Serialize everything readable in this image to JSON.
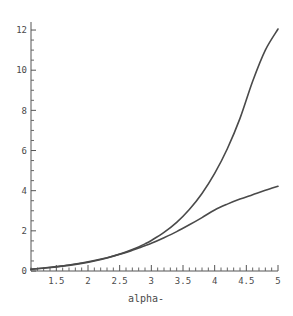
{
  "chart_data": {
    "type": "line",
    "title": "",
    "subtitle": "",
    "xlabel": "alpha-",
    "ylabel": "",
    "xlim": [
      1.1,
      5.0
    ],
    "ylim": [
      0,
      12.4
    ],
    "grid": false,
    "legend": null,
    "x_ticks": [
      {
        "value": 1.5,
        "label": "1.5"
      },
      {
        "value": 2.0,
        "label": "2"
      },
      {
        "value": 2.5,
        "label": "2.5"
      },
      {
        "value": 3.0,
        "label": "3"
      },
      {
        "value": 3.5,
        "label": "3.5"
      },
      {
        "value": 4.0,
        "label": "4"
      },
      {
        "value": 4.5,
        "label": "4.5"
      },
      {
        "value": 5.0,
        "label": "5"
      }
    ],
    "x_minor_step": 0.1,
    "y_ticks": [
      {
        "value": 0,
        "label": "0"
      },
      {
        "value": 2,
        "label": "2"
      },
      {
        "value": 4,
        "label": "4"
      },
      {
        "value": 6,
        "label": "6"
      },
      {
        "value": 8,
        "label": "8"
      },
      {
        "value": 10,
        "label": "10"
      },
      {
        "value": 12,
        "label": "12"
      }
    ],
    "y_minor_step": 0.5,
    "series": [
      {
        "name": "steep-curve",
        "color": "#4a4a4a",
        "x": [
          1.1,
          1.3,
          1.5,
          1.7,
          1.9,
          2.1,
          2.3,
          2.5,
          2.7,
          2.8,
          2.9,
          3.0,
          3.2,
          3.4,
          3.6,
          3.8,
          4.0,
          4.2,
          4.4,
          4.6,
          4.8,
          5.0
        ],
        "y": [
          0.09,
          0.14,
          0.2,
          0.28,
          0.38,
          0.5,
          0.65,
          0.84,
          1.07,
          1.2,
          1.35,
          1.52,
          1.92,
          2.42,
          3.06,
          3.86,
          4.86,
          6.09,
          7.6,
          9.45,
          11.0,
          12.05
        ]
      },
      {
        "name": "shallow-curve",
        "color": "#4a4a4a",
        "x": [
          1.1,
          1.3,
          1.5,
          1.7,
          1.9,
          2.1,
          2.3,
          2.5,
          2.7,
          2.8,
          2.9,
          3.0,
          3.2,
          3.4,
          3.6,
          3.8,
          4.0,
          4.2,
          4.4,
          4.6,
          4.8,
          5.0
        ],
        "y": [
          0.09,
          0.15,
          0.22,
          0.3,
          0.4,
          0.52,
          0.66,
          0.83,
          1.03,
          1.14,
          1.26,
          1.38,
          1.66,
          1.96,
          2.3,
          2.66,
          3.04,
          3.33,
          3.58,
          3.8,
          4.02,
          4.22
        ]
      }
    ],
    "annotations": []
  },
  "geometry": {
    "plot_left": 31,
    "plot_right": 278,
    "plot_top": 22,
    "plot_bottom": 271,
    "x_axis_y": 271,
    "y_axis_x": 31
  }
}
